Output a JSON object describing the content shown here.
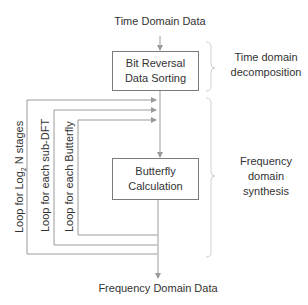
{
  "diagram": {
    "input_label": "Time Domain Data",
    "output_label": "Frequency Domain Data",
    "boxes": [
      {
        "line1": "Bit Reversal",
        "line2": "Data Sorting"
      },
      {
        "line1": "Butterfly",
        "line2": "Calculation"
      }
    ],
    "phases": [
      {
        "line1": "Time domain",
        "line2": "decomposition"
      },
      {
        "line1": "Frequency",
        "line2": "domain",
        "line3": "synthesis"
      }
    ],
    "loops": [
      {
        "label_prefix": "Loop for Log",
        "label_sub": "2",
        "label_suffix": " N stages"
      },
      {
        "label": "Loop for each sub-DFT"
      },
      {
        "label": "Loop for each Butterfly"
      }
    ],
    "colors": {
      "line": "#9a9a9a",
      "box_border": "#7a7a7a",
      "brace": "#d0d0d0",
      "text": "#333333"
    }
  }
}
